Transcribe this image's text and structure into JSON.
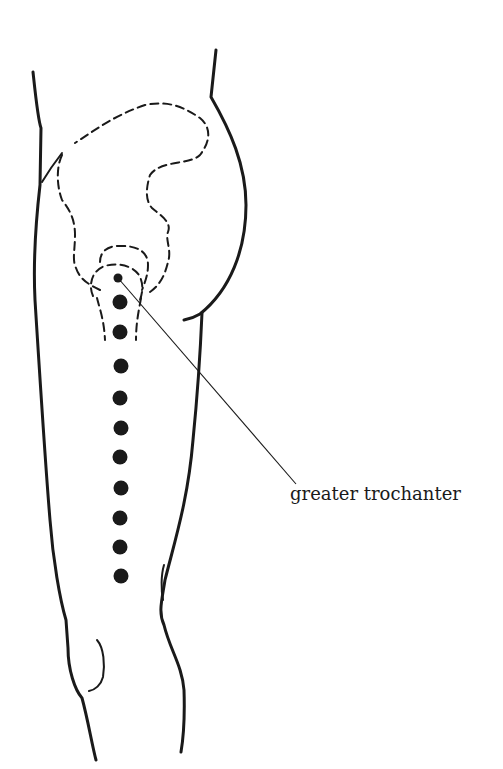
{
  "figure": {
    "label": "greater trochanter",
    "colors": {
      "ink": "#1a1a1a",
      "background": "#ffffff"
    },
    "points": {
      "trochanter_marker": {
        "x": 118,
        "y": 278,
        "r": 4
      },
      "dots": [
        {
          "x": 120,
          "y": 302
        },
        {
          "x": 120,
          "y": 332
        },
        {
          "x": 121,
          "y": 366
        },
        {
          "x": 120,
          "y": 398
        },
        {
          "x": 121,
          "y": 428
        },
        {
          "x": 120,
          "y": 457
        },
        {
          "x": 121,
          "y": 488
        },
        {
          "x": 120,
          "y": 518
        },
        {
          "x": 120,
          "y": 547
        },
        {
          "x": 121,
          "y": 576
        }
      ],
      "dot_radius": 7.5
    },
    "leader_line": {
      "x1": 118,
      "y1": 278,
      "x2": 296,
      "y2": 484
    }
  }
}
